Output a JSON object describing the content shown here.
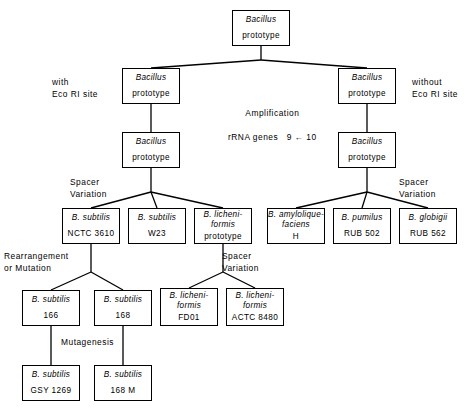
{
  "figure": {
    "ink_color": "#000000",
    "background": "#ffffff"
  },
  "boxes": [
    {
      "id": "root",
      "line1": "Bacillus",
      "line2": "prototype",
      "x": 232,
      "y": 10,
      "w": 58,
      "h": 36
    },
    {
      "id": "left_proto1",
      "line1": "Bacillus",
      "line2": "prototype",
      "x": 122,
      "y": 68,
      "w": 58,
      "h": 36
    },
    {
      "id": "right_proto1",
      "line1": "Bacillus",
      "line2": "prototype",
      "x": 338,
      "y": 68,
      "w": 58,
      "h": 36
    },
    {
      "id": "left_proto2",
      "line1": "Bacillus",
      "line2": "prototype",
      "x": 122,
      "y": 132,
      "w": 58,
      "h": 36
    },
    {
      "id": "right_proto2",
      "line1": "Bacillus",
      "line2": "prototype",
      "x": 338,
      "y": 132,
      "w": 58,
      "h": 36
    },
    {
      "id": "subtilis_nctc",
      "line1": "B. subtilis",
      "line2": "NCTC 3610",
      "x": 62,
      "y": 208,
      "w": 58,
      "h": 36
    },
    {
      "id": "subtilis_w23",
      "line1": "B. subtilis",
      "line2": "W23",
      "x": 128,
      "y": 208,
      "w": 58,
      "h": 36
    },
    {
      "id": "licheni_proto",
      "line1": "B. licheni-",
      "line1b": "formis",
      "line2": "prototype",
      "x": 194,
      "y": 208,
      "w": 58,
      "h": 36
    },
    {
      "id": "amylolique",
      "line1": "B. amylolique-",
      "line1b": "faciens",
      "line2": "H",
      "x": 267,
      "y": 208,
      "w": 58,
      "h": 36
    },
    {
      "id": "pumilus",
      "line1": "B. pumilus",
      "line2": "RUB 502",
      "x": 333,
      "y": 208,
      "w": 58,
      "h": 36
    },
    {
      "id": "globigii",
      "line1": "B. globigii",
      "line2": "RUB 562",
      "x": 399,
      "y": 208,
      "w": 58,
      "h": 36
    },
    {
      "id": "subtilis_166",
      "line1": "B. subtilis",
      "line2": "166",
      "x": 22,
      "y": 290,
      "w": 58,
      "h": 36
    },
    {
      "id": "subtilis_168",
      "line1": "B. subtilis",
      "line2": "168",
      "x": 94,
      "y": 290,
      "w": 58,
      "h": 36
    },
    {
      "id": "licheni_fd01",
      "line1": "B. licheni-",
      "line1b": "formis",
      "line2": "FD01",
      "x": 160,
      "y": 288,
      "w": 58,
      "h": 38
    },
    {
      "id": "licheni_actc",
      "line1": "B. licheni-",
      "line1b": "formis",
      "line2": "ACTC 8480",
      "x": 226,
      "y": 288,
      "w": 58,
      "h": 38
    },
    {
      "id": "subtilis_gsy",
      "line1": "B. subtilis",
      "line2": "GSY 1269",
      "x": 22,
      "y": 365,
      "w": 58,
      "h": 36
    },
    {
      "id": "subtilis_168m",
      "line1": "B. subtilis",
      "line2": "168 M",
      "x": 94,
      "y": 365,
      "w": 58,
      "h": 36
    }
  ],
  "annotations": [
    {
      "id": "with_eco",
      "text": "with\nEco RI site",
      "x": 52,
      "y": 76,
      "align": "left"
    },
    {
      "id": "without_eco",
      "text": "without\nEco RI site",
      "x": 412,
      "y": 76,
      "align": "left"
    },
    {
      "id": "amplification",
      "text": "Amplification\n\nrRNA genes   9 ← 10",
      "x": 228,
      "y": 107,
      "align": "center"
    },
    {
      "id": "spacer_left",
      "text": "Spacer\nVariation",
      "x": 70,
      "y": 176,
      "align": "left"
    },
    {
      "id": "spacer_right",
      "text": "Spacer\nVariation",
      "x": 399,
      "y": 176,
      "align": "left"
    },
    {
      "id": "rearrangement",
      "text": "Rearrangement\nor Mutation",
      "x": 4,
      "y": 250,
      "align": "left"
    },
    {
      "id": "spacer_mid",
      "text": "Spacer\nVariation",
      "x": 222,
      "y": 250,
      "align": "left"
    },
    {
      "id": "mutagenesis",
      "text": "Mutagenesis",
      "x": 61,
      "y": 336,
      "align": "left"
    }
  ],
  "edges": [
    {
      "id": "root-stem",
      "points": "261,46 261,60"
    },
    {
      "id": "root-to-left",
      "points": "261,60 151,68"
    },
    {
      "id": "root-to-right",
      "points": "261,60 367,68"
    },
    {
      "id": "left1-to-left2",
      "points": "151,104 151,132"
    },
    {
      "id": "right1-to-right2",
      "points": "367,104 367,132"
    },
    {
      "id": "left2-stem",
      "points": "151,168 151,192"
    },
    {
      "id": "left2-to-nctc",
      "points": "151,192 91,208"
    },
    {
      "id": "left2-to-w23",
      "points": "151,192 157,208"
    },
    {
      "id": "left2-to-licheni",
      "points": "151,192 223,208"
    },
    {
      "id": "right2-stem",
      "points": "367,168 367,192"
    },
    {
      "id": "right2-to-amylo",
      "points": "367,192 296,208"
    },
    {
      "id": "right2-to-pumilus",
      "points": "367,192 362,208"
    },
    {
      "id": "right2-to-globigii",
      "points": "367,192 428,208"
    },
    {
      "id": "nctc-stem",
      "points": "91,244 91,272"
    },
    {
      "id": "nctc-to-166",
      "points": "91,272 51,290"
    },
    {
      "id": "nctc-to-168",
      "points": "91,272 123,290"
    },
    {
      "id": "licheni-stem",
      "points": "223,244 223,272"
    },
    {
      "id": "licheni-to-fd01",
      "points": "223,272 189,288"
    },
    {
      "id": "licheni-to-actc",
      "points": "223,272 255,288"
    },
    {
      "id": "166-to-gsy",
      "points": "51,326 51,365"
    },
    {
      "id": "168-to-168m",
      "points": "123,326 123,365"
    }
  ]
}
